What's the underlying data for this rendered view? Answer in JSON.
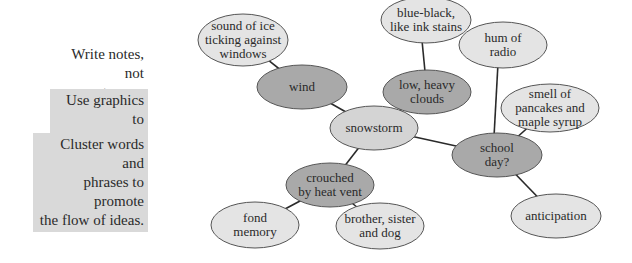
{
  "tips": [
    {
      "text": "Write notes, not sentences.",
      "lines": [
        "Write notes,",
        "not sentences."
      ],
      "shaded": false
    },
    {
      "text": "Use graphics to sort out ideas.",
      "lines": [
        "Use graphics to",
        "sort out ideas."
      ],
      "shaded": true
    },
    {
      "text": "Cluster words and phrases to promote the flow of ideas.",
      "lines": [
        "Cluster words and",
        "phrases to promote",
        "the flow of ideas."
      ],
      "shaded": true
    }
  ],
  "colors": {
    "primary_node_fill": "#a9a9a9",
    "secondary_node_fill": "#e4e4e4",
    "center_node_fill": "#d4d4d4",
    "node_stroke": "#555555",
    "edge": "#2a2a2a",
    "tip_shade": "#d9d9d9"
  },
  "diagram": {
    "center": "snowstorm",
    "nodes": [
      {
        "id": "sound_of_ice",
        "lines": [
          "sound of ice",
          "ticking against",
          "windows"
        ],
        "level": "secondary"
      },
      {
        "id": "wind",
        "lines": [
          "wind"
        ],
        "level": "primary"
      },
      {
        "id": "blue_black",
        "lines": [
          "blue-black,",
          "like ink stains"
        ],
        "level": "secondary"
      },
      {
        "id": "low_heavy_clouds",
        "lines": [
          "low, heavy",
          "clouds"
        ],
        "level": "primary"
      },
      {
        "id": "snowstorm",
        "lines": [
          "snowstorm"
        ],
        "level": "center"
      },
      {
        "id": "hum_of_radio",
        "lines": [
          "hum of",
          "radio"
        ],
        "level": "secondary"
      },
      {
        "id": "smell_of_pancakes",
        "lines": [
          "smell of",
          "pancakes and",
          "maple syrup"
        ],
        "level": "secondary"
      },
      {
        "id": "school_day",
        "lines": [
          "school",
          "day?"
        ],
        "level": "primary"
      },
      {
        "id": "anticipation",
        "lines": [
          "anticipation"
        ],
        "level": "secondary"
      },
      {
        "id": "crouched",
        "lines": [
          "crouched",
          "by heat vent"
        ],
        "level": "primary"
      },
      {
        "id": "fond_memory",
        "lines": [
          "fond",
          "memory"
        ],
        "level": "secondary"
      },
      {
        "id": "brother_sister",
        "lines": [
          "brother, sister",
          "and dog"
        ],
        "level": "secondary"
      }
    ],
    "edges": [
      [
        "snowstorm",
        "wind"
      ],
      [
        "snowstorm",
        "low_heavy_clouds"
      ],
      [
        "snowstorm",
        "school_day"
      ],
      [
        "snowstorm",
        "crouched"
      ],
      [
        "wind",
        "sound_of_ice"
      ],
      [
        "low_heavy_clouds",
        "blue_black"
      ],
      [
        "school_day",
        "hum_of_radio"
      ],
      [
        "school_day",
        "smell_of_pancakes"
      ],
      [
        "school_day",
        "anticipation"
      ],
      [
        "crouched",
        "fond_memory"
      ],
      [
        "crouched",
        "brother_sister"
      ]
    ]
  }
}
